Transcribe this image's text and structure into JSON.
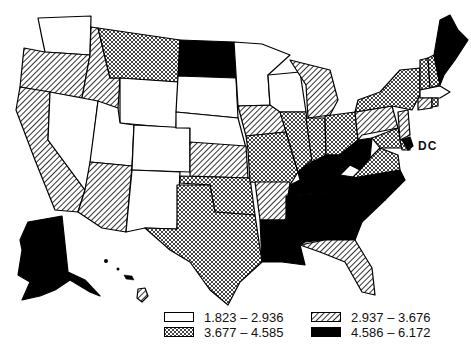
{
  "map": {
    "type": "choropleth",
    "region": "United States",
    "dc_label": "DC",
    "categories": [
      {
        "id": "c1",
        "range": "1.823 – 2.936",
        "pattern": "blank"
      },
      {
        "id": "c2",
        "range": "2.937 – 3.676",
        "pattern": "diagonal-hatch"
      },
      {
        "id": "c3",
        "range": "3.677 – 4.585",
        "pattern": "crosshatch"
      },
      {
        "id": "c4",
        "range": "4.586 – 6.172",
        "pattern": "solid-black"
      }
    ],
    "states": {
      "c1": [
        "WA",
        "NV",
        "UT",
        "WY",
        "CO",
        "NM",
        "SD",
        "NE",
        "MN",
        "WI",
        "MA"
      ],
      "c2": [
        "OR",
        "CA",
        "ID",
        "AZ",
        "KS",
        "IA",
        "MI",
        "AR",
        "FL",
        "PA",
        "HI",
        "CT",
        "NJ"
      ],
      "c3": [
        "MT",
        "TX",
        "OK",
        "MO",
        "IL",
        "IN",
        "OH",
        "NY",
        "VT",
        "NH",
        "VA",
        "MD",
        "DE",
        "RI"
      ],
      "c4": [
        "ND",
        "AK",
        "ME",
        "KY",
        "WV",
        "TN",
        "NC",
        "SC",
        "GA",
        "AL",
        "MS",
        "LA",
        "DC"
      ]
    }
  },
  "legend": {
    "items": [
      {
        "label": "1.823 – 2.936",
        "pattern": "blank"
      },
      {
        "label": "3.677 – 4.585",
        "pattern": "crosshatch"
      },
      {
        "label": "2.937 – 3.676",
        "pattern": "diagonal-hatch"
      },
      {
        "label": "4.586 – 6.172",
        "pattern": "solid-black"
      }
    ]
  },
  "colors": {
    "ink": "#000000",
    "paper": "#ffffff"
  }
}
